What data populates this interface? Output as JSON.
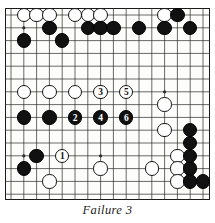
{
  "figure": {
    "caption": "Failure 3",
    "type": "go-board-diagram"
  },
  "board": {
    "cols": 16,
    "rows": 15,
    "cell": 12.8,
    "origin_x": 6.0,
    "origin_y": 7.0,
    "line_color": "#2a2a2a",
    "board_color": "#fdfdfb",
    "border_color": "#1a1a1a",
    "star_points": [
      {
        "c": 2,
        "r": 2
      },
      {
        "c": 2,
        "r": 7
      },
      {
        "c": 2,
        "r": 12
      },
      {
        "c": 8,
        "r": 7
      },
      {
        "c": 8,
        "r": 12
      },
      {
        "c": 13,
        "r": 2
      },
      {
        "c": 13,
        "r": 7
      }
    ]
  },
  "chart_data": {
    "type": "table",
    "title": "Failure 3",
    "xlabel": "board column",
    "ylabel": "board row",
    "stones": [
      {
        "c": 2,
        "r": 1,
        "color": "white",
        "label": ""
      },
      {
        "c": 3,
        "r": 1,
        "color": "white",
        "label": ""
      },
      {
        "c": 4,
        "r": 1,
        "color": "white",
        "label": ""
      },
      {
        "c": 6,
        "r": 1,
        "color": "white",
        "label": ""
      },
      {
        "c": 7,
        "r": 1,
        "color": "white",
        "label": ""
      },
      {
        "c": 8,
        "r": 1,
        "color": "white",
        "label": ""
      },
      {
        "c": 13,
        "r": 1,
        "color": "white",
        "label": ""
      },
      {
        "c": 14,
        "r": 1,
        "color": "black",
        "label": ""
      },
      {
        "c": 4,
        "r": 2,
        "color": "black",
        "label": ""
      },
      {
        "c": 7,
        "r": 2,
        "color": "black",
        "label": ""
      },
      {
        "c": 8,
        "r": 2,
        "color": "black",
        "label": ""
      },
      {
        "c": 9,
        "r": 2,
        "color": "black",
        "label": ""
      },
      {
        "c": 11,
        "r": 2,
        "color": "black",
        "label": ""
      },
      {
        "c": 13,
        "r": 2,
        "color": "black",
        "label": ""
      },
      {
        "c": 15,
        "r": 2,
        "color": "black",
        "label": ""
      },
      {
        "c": 2,
        "r": 3,
        "color": "black",
        "label": ""
      },
      {
        "c": 5,
        "r": 3,
        "color": "black",
        "label": ""
      },
      {
        "c": 2,
        "r": 7,
        "color": "white",
        "label": ""
      },
      {
        "c": 4,
        "r": 7,
        "color": "white",
        "label": ""
      },
      {
        "c": 6,
        "r": 7,
        "color": "white",
        "label": ""
      },
      {
        "c": 8,
        "r": 7,
        "color": "white",
        "label": "3"
      },
      {
        "c": 10,
        "r": 7,
        "color": "white",
        "label": "5"
      },
      {
        "c": 13,
        "r": 8,
        "color": "white",
        "label": ""
      },
      {
        "c": 2,
        "r": 9,
        "color": "black",
        "label": ""
      },
      {
        "c": 4,
        "r": 9,
        "color": "black",
        "label": ""
      },
      {
        "c": 6,
        "r": 9,
        "color": "black",
        "label": "2"
      },
      {
        "c": 8,
        "r": 9,
        "color": "black",
        "label": "4"
      },
      {
        "c": 10,
        "r": 9,
        "color": "black",
        "label": "6"
      },
      {
        "c": 13,
        "r": 10,
        "color": "white",
        "label": ""
      },
      {
        "c": 15,
        "r": 10,
        "color": "black",
        "label": ""
      },
      {
        "c": 15,
        "r": 11,
        "color": "black",
        "label": ""
      },
      {
        "c": 14,
        "r": 12,
        "color": "white",
        "label": ""
      },
      {
        "c": 14,
        "r": 13,
        "color": "white",
        "label": ""
      },
      {
        "c": 15,
        "r": 13,
        "color": "black",
        "label": ""
      },
      {
        "c": 3,
        "r": 12,
        "color": "black",
        "label": ""
      },
      {
        "c": 5,
        "r": 12,
        "color": "white",
        "label": "1"
      },
      {
        "c": 2,
        "r": 13,
        "color": "black",
        "label": ""
      },
      {
        "c": 8,
        "r": 13,
        "color": "white",
        "label": ""
      },
      {
        "c": 12,
        "r": 13,
        "color": "white",
        "label": ""
      },
      {
        "c": 14,
        "r": 14,
        "color": "white",
        "label": ""
      },
      {
        "c": 15,
        "r": 14,
        "color": "black",
        "label": ""
      },
      {
        "c": 16,
        "r": 14,
        "color": "black",
        "label": ""
      },
      {
        "c": 15,
        "r": 12,
        "color": "black",
        "label": ""
      },
      {
        "c": 4,
        "r": 14,
        "color": "white",
        "label": ""
      }
    ],
    "move_sequence": [
      {
        "move": 1,
        "color": "white",
        "c": 5,
        "r": 12
      },
      {
        "move": 2,
        "color": "black",
        "c": 6,
        "r": 9
      },
      {
        "move": 3,
        "color": "white",
        "c": 8,
        "r": 7
      },
      {
        "move": 4,
        "color": "black",
        "c": 8,
        "r": 9
      },
      {
        "move": 5,
        "color": "white",
        "c": 10,
        "r": 7
      },
      {
        "move": 6,
        "color": "black",
        "c": 10,
        "r": 9
      }
    ],
    "legend": [
      "numbered stones show move order",
      "white = circles",
      "black = filled"
    ],
    "grid": true
  }
}
